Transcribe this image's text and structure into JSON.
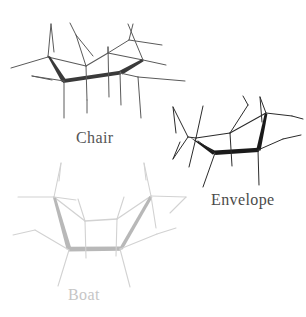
{
  "figure": {
    "background_color": "#ffffff",
    "width": 306,
    "height": 317,
    "colors": {
      "chair_thin": "#5a5a5a",
      "chair_bold": "#3a3a3a",
      "envelope_thin": "#2b2b2b",
      "envelope_bold": "#1a1a1a",
      "boat_thin": "#d2d2d2",
      "boat_bold": "#b8b8b8",
      "label_chair": "#555555",
      "label_envelope": "#4a4a4a",
      "label_boat": "#c6c6c6"
    }
  },
  "conformers": [
    {
      "id": "chair",
      "label": "Chair",
      "label_color": "#555555",
      "ring_color": "#5a5a5a",
      "bold_color": "#3a3a3a",
      "ring_vertices": [
        [
          48,
          57
        ],
        [
          86,
          66
        ],
        [
          108,
          53
        ],
        [
          143,
          60
        ],
        [
          120,
          73
        ],
        [
          64,
          81
        ]
      ],
      "bold_bonds": [
        [
          [
            48,
            57
          ],
          [
            64,
            81
          ]
        ],
        [
          [
            64,
            81
          ],
          [
            120,
            73
          ]
        ],
        [
          [
            120,
            73
          ],
          [
            143,
            60
          ]
        ]
      ],
      "substituent_count": 12
    },
    {
      "id": "envelope",
      "label": "Envelope",
      "label_color": "#4a4a4a",
      "ring_color": "#2b2b2b",
      "bold_color": "#1a1a1a",
      "ring_vertices": [
        [
          188,
          137
        ],
        [
          215,
          153
        ],
        [
          258,
          150
        ],
        [
          266,
          113
        ],
        [
          230,
          133
        ],
        [
          196,
          138
        ]
      ],
      "bold_bonds": [
        [
          [
            188,
            137
          ],
          [
            215,
            153
          ]
        ],
        [
          [
            215,
            153
          ],
          [
            258,
            150
          ]
        ],
        [
          [
            258,
            150
          ],
          [
            266,
            113
          ]
        ]
      ],
      "substituent_count": 12
    },
    {
      "id": "boat",
      "label": "Boat",
      "label_color": "#c6c6c6",
      "ring_color": "#d2d2d2",
      "bold_color": "#b8b8b8",
      "ring_vertices": [
        [
          54,
          197
        ],
        [
          69,
          250
        ],
        [
          120,
          249
        ],
        [
          151,
          196
        ],
        [
          117,
          219
        ],
        [
          85,
          221
        ]
      ],
      "bold_bonds": [
        [
          [
            54,
            197
          ],
          [
            69,
            250
          ]
        ],
        [
          [
            69,
            250
          ],
          [
            120,
            249
          ]
        ],
        [
          [
            120,
            249
          ],
          [
            151,
            196
          ]
        ]
      ],
      "substituent_count": 12
    }
  ]
}
